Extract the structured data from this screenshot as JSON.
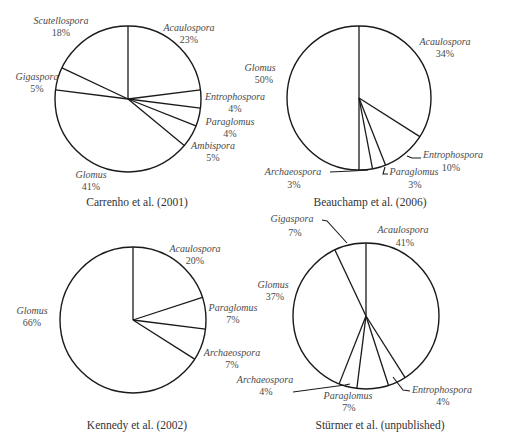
{
  "figure": {
    "background": "#ffffff",
    "stroke_color": "#1a1a1a",
    "text_color": "#4a4a4a"
  },
  "chart_data": [
    {
      "type": "pie",
      "title": "Carrenho et al. (2001)",
      "start_angle_deg": 0,
      "direction": "clockwise",
      "center": [
        128,
        99
      ],
      "radius": 73,
      "caption_pos": [
        137,
        206
      ],
      "slices": [
        {
          "label": "Acaulospora",
          "value": 23,
          "pct_text": "23%",
          "label_pos": [
            189,
            31
          ],
          "pct_pos": [
            189,
            43
          ],
          "anchor": "middle"
        },
        {
          "label": "Entrophospora",
          "value": 4,
          "pct_text": "4%",
          "label_pos": [
            235,
            100
          ],
          "pct_pos": [
            235,
            112
          ],
          "anchor": "middle"
        },
        {
          "label": "Paraglomus",
          "value": 4,
          "pct_text": "4%",
          "label_pos": [
            230,
            125
          ],
          "pct_pos": [
            230,
            137
          ],
          "anchor": "middle"
        },
        {
          "label": "Ambispora",
          "value": 5,
          "pct_text": "5%",
          "label_pos": [
            213,
            149
          ],
          "pct_pos": [
            213,
            161
          ],
          "anchor": "middle"
        },
        {
          "label": "Glomus",
          "value": 41,
          "pct_text": "41%",
          "label_pos": [
            91,
            178
          ],
          "pct_pos": [
            91,
            190
          ],
          "anchor": "middle"
        },
        {
          "label": "Gigaspora",
          "value": 5,
          "pct_text": "5%",
          "label_pos": [
            37,
            80
          ],
          "pct_pos": [
            37,
            92
          ],
          "anchor": "middle"
        },
        {
          "label": "Scutellospora",
          "value": 18,
          "pct_text": "18%",
          "label_pos": [
            61,
            24
          ],
          "pct_pos": [
            61,
            36
          ],
          "anchor": "middle"
        }
      ],
      "leaders": []
    },
    {
      "type": "pie",
      "title": "Beauchamp et al. (2006)",
      "start_angle_deg": 0,
      "direction": "clockwise",
      "center": [
        359,
        98
      ],
      "radius": 72,
      "caption_pos": [
        370,
        206
      ],
      "slices": [
        {
          "label": "Acaulospora",
          "value": 34,
          "pct_text": "34%",
          "label_pos": [
            445,
            45
          ],
          "pct_pos": [
            445,
            57
          ],
          "anchor": "middle"
        },
        {
          "label": "Entrophospora",
          "value": 10,
          "pct_text": "10%",
          "label_pos": [
            453,
            158
          ],
          "pct_pos": [
            451,
            171
          ],
          "anchor": "middle"
        },
        {
          "label": "Paraglomus",
          "value": 3,
          "pct_text": "3%",
          "label_pos": [
            414,
            175
          ],
          "pct_pos": [
            415,
            188
          ],
          "anchor": "middle"
        },
        {
          "label": "Archaeospora",
          "value": 3,
          "pct_text": "3%",
          "label_pos": [
            293,
            175
          ],
          "pct_pos": [
            294,
            188
          ],
          "anchor": "middle"
        },
        {
          "label": "Glomus",
          "value": 50,
          "pct_text": "50%",
          "label_pos": [
            260,
            71
          ],
          "pct_pos": [
            264,
            83
          ],
          "anchor": "middle"
        }
      ],
      "leaders": [
        {
          "points": [
            [
              407,
              156
            ],
            [
              412,
              158
            ],
            [
              421,
              158
            ]
          ]
        },
        {
          "points": [
            [
              385,
              167
            ],
            [
              383,
              174
            ],
            [
              388,
              174
            ]
          ]
        },
        {
          "points": [
            [
              330,
              172
            ],
            [
              352,
              171
            ],
            [
              368,
              170
            ]
          ]
        }
      ]
    },
    {
      "type": "pie",
      "title": "Kennedy et al. (2002)",
      "start_angle_deg": 0,
      "direction": "clockwise",
      "center": [
        133,
        320
      ],
      "radius": 73,
      "caption_pos": [
        137,
        429
      ],
      "slices": [
        {
          "label": "Acaulospora",
          "value": 20,
          "pct_text": "20%",
          "label_pos": [
            195,
            252
          ],
          "pct_pos": [
            195,
            264
          ],
          "anchor": "middle"
        },
        {
          "label": "Paraglomus",
          "value": 7,
          "pct_text": "7%",
          "label_pos": [
            233,
            311
          ],
          "pct_pos": [
            233,
            323
          ],
          "anchor": "middle"
        },
        {
          "label": "Archaeospora",
          "value": 7,
          "pct_text": "7%",
          "label_pos": [
            232,
            356
          ],
          "pct_pos": [
            232,
            368
          ],
          "anchor": "middle"
        },
        {
          "label": "Glomus",
          "value": 66,
          "pct_text": "66%",
          "label_pos": [
            32,
            314
          ],
          "pct_pos": [
            32,
            326
          ],
          "anchor": "middle"
        }
      ],
      "leaders": []
    },
    {
      "type": "pie",
      "title": "Stürmer et al. (unpublished)",
      "start_angle_deg": 0,
      "direction": "clockwise",
      "center": [
        366,
        316
      ],
      "radius": 73,
      "caption_pos": [
        380,
        429
      ],
      "slices": [
        {
          "label": "Acaulospora",
          "value": 41,
          "pct_text": "41%",
          "label_pos": [
            403,
            233
          ],
          "pct_pos": [
            405,
            246
          ],
          "anchor": "middle"
        },
        {
          "label": "Entrophospora",
          "value": 4,
          "pct_text": "4%",
          "label_pos": [
            442,
            393
          ],
          "pct_pos": [
            443,
            405
          ],
          "anchor": "middle"
        },
        {
          "label": "Paraglomus",
          "value": 7,
          "pct_text": "7%",
          "label_pos": [
            348,
            399
          ],
          "pct_pos": [
            349,
            411
          ],
          "anchor": "middle"
        },
        {
          "label": "Archaeospora",
          "value": 4,
          "pct_text": "4%",
          "label_pos": [
            265,
            383
          ],
          "pct_pos": [
            266,
            395
          ],
          "anchor": "middle"
        },
        {
          "label": "Glomus",
          "value": 37,
          "pct_text": "37%",
          "label_pos": [
            273,
            288
          ],
          "pct_pos": [
            275,
            300
          ],
          "anchor": "middle"
        },
        {
          "label": "Gigaspora",
          "value": 7,
          "pct_text": "7%",
          "label_pos": [
            292,
            222
          ],
          "pct_pos": [
            295,
            236
          ],
          "anchor": "middle"
        }
      ],
      "leaders": [
        {
          "points": [
            [
              322,
              220
            ],
            [
              327,
              221
            ],
            [
              347,
              243
            ]
          ]
        },
        {
          "points": [
            [
              393,
              377
            ],
            [
              403,
              390
            ],
            [
              410,
              391
            ]
          ]
        },
        {
          "points": [
            [
              293,
              392
            ],
            [
              345,
              385
            ],
            [
              350,
              384
            ]
          ]
        }
      ]
    }
  ]
}
